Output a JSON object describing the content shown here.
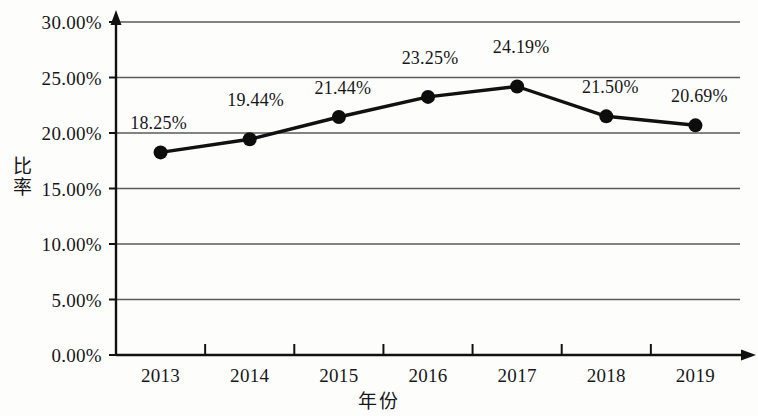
{
  "chart_data": {
    "type": "line",
    "title": "",
    "subtitle": "",
    "xlabel": "年份",
    "ylabel": "比率",
    "categories": [
      "2013",
      "2014",
      "2015",
      "2016",
      "2017",
      "2018",
      "2019"
    ],
    "values": [
      18.25,
      19.44,
      21.44,
      23.25,
      24.19,
      21.5,
      20.69
    ],
    "point_labels": [
      "18.25%",
      "19.44%",
      "21.44%",
      "23.25%",
      "24.19%",
      "21.50%",
      "20.69%"
    ],
    "ytick_labels": [
      "0.00%",
      "5.00%",
      "10.00%",
      "15.00%",
      "20.00%",
      "25.00%",
      "30.00%"
    ],
    "ytick_values": [
      0,
      5,
      10,
      15,
      20,
      25,
      30
    ],
    "ylim": [
      0,
      30
    ],
    "grid": "horizontal",
    "legend": "none",
    "series": [
      {
        "name": "比率",
        "values": [
          18.25,
          19.44,
          21.44,
          23.25,
          24.19,
          21.5,
          20.69
        ]
      }
    ],
    "colors": {
      "line": "#111111",
      "marker": "#0d0d0d",
      "axis": "#111111",
      "grid": "#5a5a5a",
      "background": "#fdfdfb",
      "text": "#17171a"
    }
  }
}
